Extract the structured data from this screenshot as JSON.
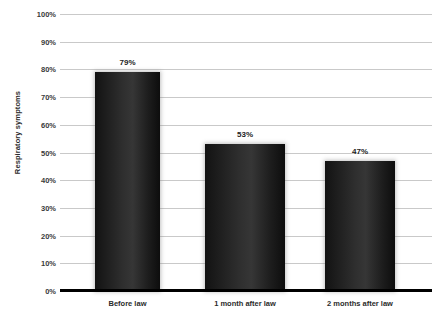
{
  "chart_data": {
    "type": "bar",
    "title": "",
    "subtitle": "",
    "xlabel": "",
    "ylabel": "Respiratory symptoms",
    "categories": [
      "Before law",
      "1 month after law",
      "2 months after law"
    ],
    "values": [
      79,
      53,
      47
    ],
    "value_labels": [
      "79%",
      "53%",
      "47%"
    ],
    "ylim": [
      0,
      100
    ],
    "ytick_values": [
      100,
      90,
      80,
      70,
      60,
      50,
      40,
      30,
      20,
      10,
      0
    ],
    "ytick_labels": [
      "100%",
      "90%",
      "80%",
      "70%",
      "60%",
      "50%",
      "40%",
      "30%",
      "20%",
      "10%",
      "0%"
    ],
    "grid": "horizontal",
    "legend": "none",
    "series": [
      {
        "name": "Respiratory symptoms",
        "values": [
          79,
          53,
          47
        ],
        "color": "#1f1f1f"
      }
    ],
    "colors": {
      "bar": "#1f1f1f",
      "gridline": "#c9c9c9",
      "axis": "#000000",
      "text": "#2b2b2b",
      "background": "#ffffff"
    }
  }
}
